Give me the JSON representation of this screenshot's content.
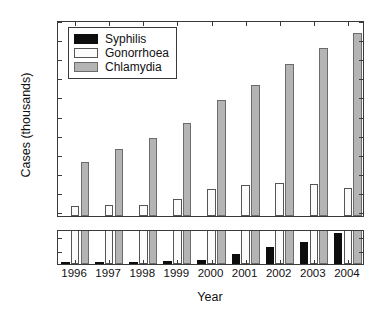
{
  "chart_data": {
    "type": "bar",
    "title": "",
    "xlabel": "Year",
    "ylabel": "Cases (thousands)",
    "categories": [
      "1996",
      "1997",
      "1998",
      "1999",
      "2000",
      "2001",
      "2002",
      "2003",
      "2004"
    ],
    "series": [
      {
        "name": "Syphilis",
        "color": "#0d0d0d",
        "values": [
          0.13,
          0.14,
          0.12,
          0.19,
          0.3,
          0.7,
          1.2,
          1.6,
          2.2
        ]
      },
      {
        "name": "Gonorrhoea",
        "color": "#fbfbfb",
        "values": [
          12.5,
          13.0,
          13.0,
          16.3,
          21.8,
          23.6,
          25.0,
          24.5,
          21.9
        ]
      },
      {
        "name": "Chlamydia",
        "color": "#b4b4b4",
        "values": [
          35.9,
          42.6,
          48.5,
          56.3,
          68.0,
          76.0,
          87.2,
          95.3,
          103.2
        ]
      }
    ],
    "broken_axis": true,
    "upper_panel": {
      "ylim": [
        7.5,
        110
      ],
      "yticks": [
        10,
        20,
        30,
        40,
        50,
        60,
        70,
        80,
        90,
        100,
        110
      ],
      "yticklabels": [
        "10",
        "20",
        "30",
        "40",
        "50",
        "60",
        "70",
        "80",
        "90",
        "100",
        "110"
      ]
    },
    "lower_panel": {
      "ylim": [
        0,
        2.5
      ],
      "yticks": [
        0,
        1,
        2
      ],
      "yticklabels": [
        "0",
        "1",
        "2"
      ]
    },
    "grid": false,
    "legend": {
      "position": "upper-left",
      "entries": [
        "Syphilis",
        "Gonorrhoea",
        "Chlamydia"
      ]
    }
  }
}
